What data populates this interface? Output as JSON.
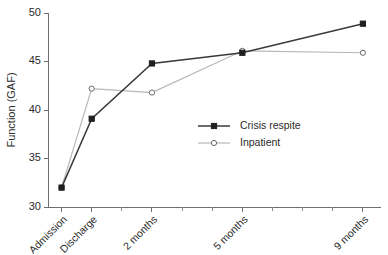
{
  "chart_data": {
    "type": "line",
    "title": "",
    "xlabel": "",
    "ylabel": "Function (GAF)",
    "categories": [
      "Admission",
      "Discharge",
      "2 months",
      "5 months",
      "9 months"
    ],
    "x": [
      0,
      1,
      3,
      6,
      10
    ],
    "xlim": [
      -0.45,
      10.6
    ],
    "ylim": [
      30,
      50
    ],
    "yticks": [
      30,
      35,
      40,
      45,
      50
    ],
    "ytick_labels": [
      "30",
      "35",
      "40",
      "45",
      "50"
    ],
    "grid": false,
    "legend_position": "center-right",
    "series": [
      {
        "name": "Crisis respite",
        "values": [
          32.0,
          39.1,
          44.8,
          45.9,
          48.9
        ],
        "color": "#3a3a3a",
        "marker": "filled-square"
      },
      {
        "name": "Inpatient",
        "values": [
          32.0,
          42.2,
          41.8,
          46.1,
          45.9
        ],
        "color": "#b7b7b7",
        "marker": "open-circle"
      }
    ],
    "minor_tick_count_between": 1
  },
  "legend": {
    "entries": [
      {
        "label": "Crisis respite"
      },
      {
        "label": "Inpatient"
      }
    ]
  },
  "axes": {
    "y_title": "Function (GAF)"
  }
}
